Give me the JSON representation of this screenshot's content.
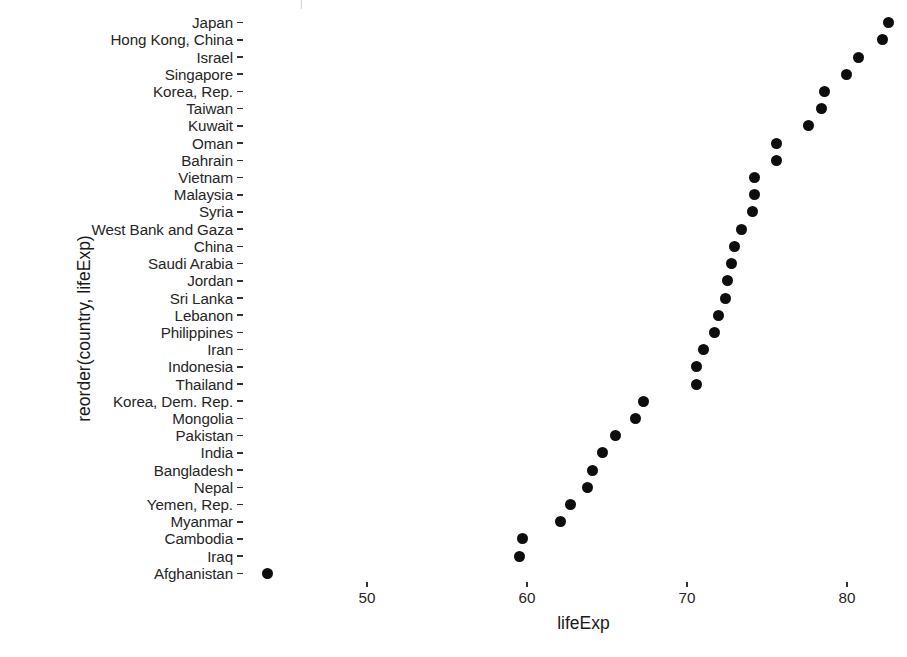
{
  "chart_data": {
    "type": "scatter",
    "title": "",
    "subtitle": "",
    "xlabel": "lifeExp",
    "ylabel": "reorder(country, lifeExp)",
    "xlim": [
      43.0,
      83.5
    ],
    "xticks": [
      50,
      60,
      70,
      80
    ],
    "xtick_labels": [
      "50",
      "60",
      "70",
      "80"
    ],
    "grid": false,
    "legend": null,
    "point_color": "#0d0d0d",
    "background": "#ffffff",
    "orientation": "horizontal-dotplot",
    "categories": [
      "Japan",
      "Hong Kong, China",
      "Israel",
      "Singapore",
      "Korea, Rep.",
      "Taiwan",
      "Kuwait",
      "Oman",
      "Bahrain",
      "Vietnam",
      "Malaysia",
      "Syria",
      "West Bank and Gaza",
      "China",
      "Saudi Arabia",
      "Jordan",
      "Sri Lanka",
      "Lebanon",
      "Philippines",
      "Iran",
      "Indonesia",
      "Thailand",
      "Korea, Dem. Rep.",
      "Mongolia",
      "Pakistan",
      "India",
      "Bangladesh",
      "Nepal",
      "Yemen, Rep.",
      "Myanmar",
      "Cambodia",
      "Iraq",
      "Afghanistan"
    ],
    "values": [
      82.6,
      82.2,
      80.7,
      79.97,
      78.6,
      78.4,
      77.6,
      75.6,
      75.6,
      74.2,
      74.2,
      74.1,
      73.4,
      72.96,
      72.8,
      72.5,
      72.4,
      71.99,
      71.7,
      71.0,
      70.6,
      70.6,
      67.3,
      66.8,
      65.5,
      64.7,
      64.1,
      63.8,
      62.7,
      62.1,
      59.7,
      59.5,
      43.8
    ]
  },
  "axes": {
    "y_title": "reorder(country, lifeExp)",
    "x_title": "lifeExp"
  }
}
